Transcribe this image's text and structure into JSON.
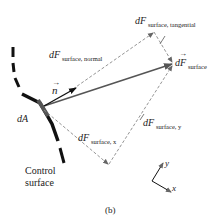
{
  "figure": {
    "panel_label": "(b)",
    "labels": {
      "normal_vector": "n",
      "area": "dA",
      "control_surface_line1": "Control",
      "control_surface_line2": "surface",
      "force_main": "dF",
      "force_main_sub": "surface",
      "force_normal": "dF",
      "force_normal_sub": "surface, normal",
      "force_tangential": "dF",
      "force_tangential_sub": "surface, tangential",
      "force_x": "dF",
      "force_x_sub": "surface, x",
      "force_y": "dF",
      "force_y_sub": "surface, y",
      "axis_x": "x",
      "axis_y": "y"
    },
    "colors": {
      "main_vector": "#555555",
      "normal_vector": "#111111",
      "dashed": "#777777",
      "surface": "#111111"
    }
  }
}
